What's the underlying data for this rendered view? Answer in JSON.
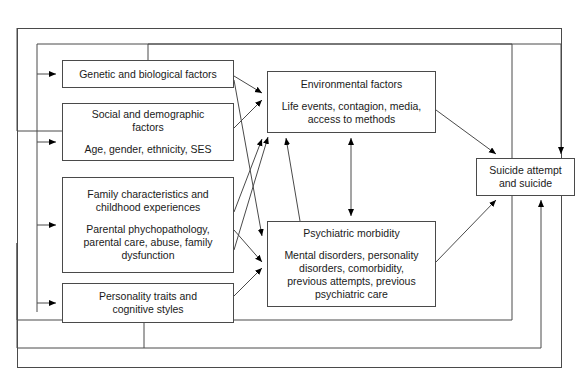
{
  "diagram": {
    "type": "flow-model",
    "title": "",
    "frame": {
      "label": "outer-frame"
    },
    "nodes": [
      {
        "id": "genetic",
        "title": "Genetic and biological factors",
        "detail": "",
        "x": 62,
        "y": 60,
        "w": 172,
        "h": 28
      },
      {
        "id": "social",
        "title": "Social and demographic\nfactors",
        "detail": "Age, gender, ethnicity, SES",
        "x": 62,
        "y": 103,
        "w": 172,
        "h": 58
      },
      {
        "id": "family",
        "title": "Family characteristics and\nchildhood experiences",
        "detail": "Parental phychopathology,\nparental care, abuse, family\ndysfunction",
        "x": 62,
        "y": 177,
        "w": 172,
        "h": 96
      },
      {
        "id": "personality",
        "title": "Personality traits and\ncognitive styles",
        "detail": "",
        "x": 62,
        "y": 283,
        "w": 172,
        "h": 40
      },
      {
        "id": "environmental",
        "title": "Environmental factors",
        "detail": "Life events, contagion, media,\naccess to methods",
        "x": 267,
        "y": 71,
        "w": 169,
        "h": 62
      },
      {
        "id": "psychiatric",
        "title": "Psychiatric morbidity",
        "detail": "Mental disorders, personality\ndisorders, comorbidity,\nprevious attempts, previous\npsychiatric care",
        "x": 267,
        "y": 221,
        "w": 169,
        "h": 86
      },
      {
        "id": "suicide",
        "title": "Suicide attempt\nand suicide",
        "detail": "",
        "x": 476,
        "y": 158,
        "w": 99,
        "h": 38
      }
    ],
    "edges": [
      {
        "from": "genetic",
        "to": "environmental",
        "kind": "arrow"
      },
      {
        "from": "genetic",
        "to": "psychiatric",
        "kind": "arrow"
      },
      {
        "from": "social",
        "to": "environmental",
        "kind": "arrow"
      },
      {
        "from": "family",
        "to": "environmental",
        "kind": "arrow"
      },
      {
        "from": "family",
        "to": "psychiatric",
        "kind": "arrow"
      },
      {
        "from": "personality",
        "to": "psychiatric",
        "kind": "arrow"
      },
      {
        "from": "environmental",
        "to": "psychiatric",
        "kind": "double-arrow"
      },
      {
        "from": "environmental",
        "to": "suicide",
        "kind": "arrow"
      },
      {
        "from": "psychiatric",
        "to": "suicide",
        "kind": "arrow"
      },
      {
        "from": "genetic",
        "to": "suicide",
        "kind": "routed-arrow"
      },
      {
        "from": "personality",
        "to": "suicide",
        "kind": "routed-arrow"
      },
      {
        "from": "suicide",
        "to": "genetic",
        "kind": "feedback-arrow"
      },
      {
        "from": "suicide",
        "to": "social",
        "kind": "feedback-arrow"
      },
      {
        "from": "suicide",
        "to": "family",
        "kind": "feedback-arrow"
      },
      {
        "from": "suicide",
        "to": "personality",
        "kind": "feedback-arrow"
      }
    ],
    "colors": {
      "stroke": "#4a4a4a",
      "text": "#1a1a1a",
      "background": "#ffffff",
      "arrow": "#000000"
    }
  }
}
